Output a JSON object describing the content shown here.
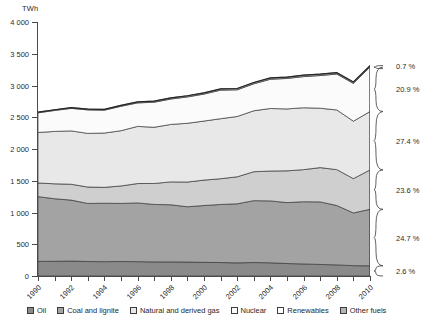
{
  "chart_data": {
    "type": "area",
    "title": "",
    "subtitle": "",
    "xlabel": "",
    "ylabel": "TWh",
    "unit_label": "TWh",
    "stacked": true,
    "grid": false,
    "legend_position": "bottom",
    "xlim": [
      1990,
      2010
    ],
    "ylim": [
      0,
      4000
    ],
    "ytick_labels": [
      "0",
      "500",
      "1 000",
      "1 500",
      "2 000",
      "2 500",
      "3 000",
      "3 500",
      "4 000"
    ],
    "ytick_values": [
      0,
      500,
      1000,
      1500,
      2000,
      2500,
      3000,
      3500,
      4000
    ],
    "xtick_labels": [
      "1990",
      "1992",
      "1994",
      "1996",
      "1998",
      "2000",
      "2002",
      "2004",
      "2006",
      "2008",
      "2010"
    ],
    "xtick_values": [
      1990,
      1992,
      1994,
      1996,
      1998,
      2000,
      2002,
      2004,
      2006,
      2008,
      2010
    ],
    "x": [
      1990,
      1991,
      1992,
      1993,
      1994,
      1995,
      1996,
      1997,
      1998,
      1999,
      2000,
      2001,
      2002,
      2003,
      2004,
      2005,
      2006,
      2007,
      2008,
      2009,
      2010
    ],
    "series": [
      {
        "name": "Oil",
        "color": "#8a8a8a",
        "percent_2010": "2.6 %",
        "values": [
          230,
          232,
          235,
          228,
          226,
          228,
          226,
          222,
          222,
          220,
          215,
          212,
          207,
          212,
          208,
          196,
          190,
          182,
          175,
          163,
          160
        ]
      },
      {
        "name": "Coal and lignite",
        "color": "#a3a3a3",
        "percent_2010": "24.7 %",
        "values": [
          1020,
          985,
          960,
          915,
          920,
          915,
          925,
          905,
          900,
          870,
          895,
          915,
          930,
          975,
          975,
          960,
          980,
          985,
          935,
          830,
          890
        ]
      },
      {
        "name": "Natural and derived gas",
        "color": "#cfcfcf",
        "percent_2010": "23.6 %",
        "values": [
          215,
          235,
          250,
          258,
          250,
          275,
          305,
          330,
          360,
          390,
          400,
          405,
          425,
          455,
          470,
          500,
          505,
          540,
          565,
          540,
          620
        ]
      },
      {
        "name": "Nuclear",
        "color": "#e8e8e8",
        "percent_2010": "27.4 %",
        "values": [
          795,
          825,
          840,
          845,
          855,
          870,
          900,
          885,
          905,
          925,
          930,
          945,
          950,
          960,
          985,
          975,
          975,
          935,
          940,
          905,
          920
        ]
      },
      {
        "name": "Renewables",
        "color": "#fbfbfb",
        "percent_2010": "20.9 %",
        "values": [
          310,
          330,
          355,
          370,
          360,
          385,
          370,
          395,
          400,
          415,
          425,
          450,
          420,
          425,
          460,
          480,
          490,
          515,
          565,
          595,
          700
        ]
      },
      {
        "name": "Other fuels",
        "color": "#b5b5b5",
        "percent_2010": "0.7 %",
        "values": [
          10,
          11,
          12,
          13,
          14,
          15,
          16,
          17,
          18,
          19,
          20,
          20,
          21,
          21,
          22,
          22,
          23,
          23,
          23,
          22,
          23
        ]
      }
    ],
    "annotations": [
      {
        "label": "0.7 %",
        "series": "Other fuels"
      },
      {
        "label": "20.9 %",
        "series": "Renewables"
      },
      {
        "label": "27.4 %",
        "series": "Nuclear"
      },
      {
        "label": "23.6 %",
        "series": "Natural and derived gas"
      },
      {
        "label": "24.7 %",
        "series": "Coal and lignite"
      },
      {
        "label": "2.6 %",
        "series": "Oil"
      }
    ]
  },
  "legend": {
    "items": [
      {
        "label": "Oil",
        "color": "#8a8a8a"
      },
      {
        "label": "Coal and lignite",
        "color": "#a3a3a3"
      },
      {
        "label": "Natural and derived gas",
        "color": "#e8e8e8"
      },
      {
        "label": "Nuclear",
        "color": "#fbfbfb"
      },
      {
        "label": "Renewables",
        "color": "#ffffff"
      },
      {
        "label": "Other fuels",
        "color": "#b5b5b5"
      }
    ]
  }
}
